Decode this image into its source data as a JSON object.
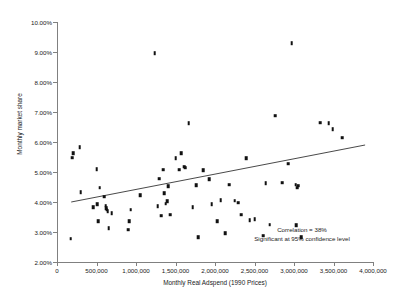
{
  "chart_data": {
    "type": "scatter",
    "title": "",
    "xlabel": "Monthly Real Adspend (1990 Prices)",
    "ylabel": "Monthly market share",
    "xlim": [
      0,
      4000000
    ],
    "ylim": [
      2.0,
      10.0
    ],
    "grid": false,
    "legend": null,
    "x_ticks": [
      0,
      500000,
      1000000,
      1500000,
      2000000,
      2500000,
      3000000,
      3500000,
      4000000
    ],
    "x_tick_labels": [
      "0",
      "500,000",
      "1,000,000",
      "1,500,000",
      "2,000,000",
      "2,500,000",
      "3,000,000",
      "3,500,000",
      "4,000,000"
    ],
    "y_ticks": [
      2.0,
      3.0,
      4.0,
      5.0,
      6.0,
      7.0,
      8.0,
      9.0,
      10.0
    ],
    "y_tick_labels": [
      "2.00%",
      "3.00%",
      "4.00%",
      "5.00%",
      "6.00%",
      "7.00%",
      "8.00%",
      "9.00%",
      "10.00%"
    ],
    "marker_color": "#111111",
    "axis_color": "#808080",
    "points": [
      [
        175000,
        2.78
      ],
      [
        190000,
        5.48
      ],
      [
        205000,
        5.62
      ],
      [
        285000,
        5.82
      ],
      [
        300000,
        4.32
      ],
      [
        455000,
        3.82
      ],
      [
        500000,
        5.1
      ],
      [
        510000,
        3.92
      ],
      [
        520000,
        3.36
      ],
      [
        540000,
        4.48
      ],
      [
        600000,
        4.18
      ],
      [
        615000,
        3.88
      ],
      [
        625000,
        3.8
      ],
      [
        630000,
        3.74
      ],
      [
        640000,
        3.7
      ],
      [
        655000,
        3.12
      ],
      [
        690000,
        3.62
      ],
      [
        900000,
        3.08
      ],
      [
        915000,
        3.36
      ],
      [
        935000,
        3.74
      ],
      [
        1050000,
        4.22
      ],
      [
        1235000,
        8.96
      ],
      [
        1275000,
        3.86
      ],
      [
        1295000,
        4.78
      ],
      [
        1320000,
        3.54
      ],
      [
        1345000,
        5.08
      ],
      [
        1355000,
        4.3
      ],
      [
        1375000,
        3.94
      ],
      [
        1395000,
        4.02
      ],
      [
        1410000,
        4.52
      ],
      [
        1430000,
        3.58
      ],
      [
        1500000,
        5.46
      ],
      [
        1545000,
        5.08
      ],
      [
        1570000,
        5.62
      ],
      [
        1610000,
        5.18
      ],
      [
        1625000,
        5.14
      ],
      [
        1665000,
        6.62
      ],
      [
        1720000,
        3.82
      ],
      [
        1760000,
        4.56
      ],
      [
        1790000,
        2.82
      ],
      [
        1850000,
        5.06
      ],
      [
        1930000,
        4.76
      ],
      [
        1960000,
        3.92
      ],
      [
        2030000,
        3.36
      ],
      [
        2070000,
        4.06
      ],
      [
        2130000,
        2.96
      ],
      [
        2180000,
        4.58
      ],
      [
        2250000,
        4.04
      ],
      [
        2290000,
        3.98
      ],
      [
        2330000,
        3.58
      ],
      [
        2395000,
        5.46
      ],
      [
        2440000,
        3.4
      ],
      [
        2505000,
        3.42
      ],
      [
        2610000,
        2.88
      ],
      [
        2640000,
        4.62
      ],
      [
        2690000,
        3.24
      ],
      [
        2760000,
        6.88
      ],
      [
        2850000,
        4.64
      ],
      [
        2930000,
        5.28
      ],
      [
        2970000,
        9.3
      ],
      [
        3020000,
        4.58
      ],
      [
        3030000,
        3.22
      ],
      [
        3040000,
        4.48
      ],
      [
        3050000,
        4.54
      ],
      [
        3090000,
        2.82
      ],
      [
        3330000,
        6.64
      ],
      [
        3440000,
        6.62
      ],
      [
        3490000,
        6.42
      ],
      [
        3610000,
        6.14
      ]
    ],
    "trend_line": {
      "x_start": 180000,
      "y_start": 4.0,
      "x_end": 3900000,
      "y_end": 5.9
    },
    "annotations": [
      "Correlation = 38%",
      "Significant at 95% confidence level"
    ]
  }
}
